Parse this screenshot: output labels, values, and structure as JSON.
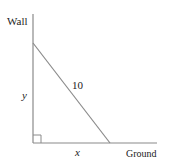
{
  "diagram": {
    "labels": {
      "wall": "Wall",
      "ground": "Ground",
      "ladder_length": "10",
      "height_var": "y",
      "base_var": "x"
    },
    "colors": {
      "line": "#8a8a8a",
      "text": "#222222",
      "background": "#ffffff"
    },
    "right_angle_marker": true
  }
}
